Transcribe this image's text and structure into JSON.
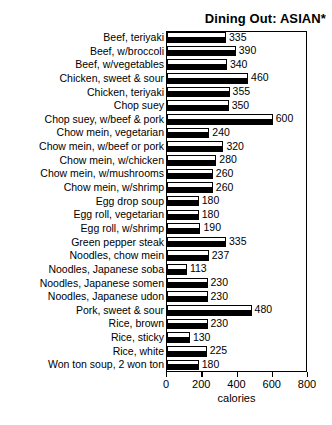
{
  "chart_data": {
    "type": "bar",
    "orientation": "horizontal",
    "title": "Dining Out: ASIAN*",
    "xlabel": "calories",
    "ylabel": "",
    "xlim": [
      0,
      800
    ],
    "xticks": [
      0,
      200,
      400,
      600,
      800
    ],
    "xtick_labels": [
      "0",
      "200",
      "400",
      "600",
      "800"
    ],
    "grid": false,
    "legend": false,
    "bar_style": {
      "face_color": "#ffffff",
      "edge_color": "#000000",
      "shadow_color": "#000000"
    },
    "categories": [
      "Beef, teriyaki",
      "Beef, w/broccoli",
      "Beef, w/vegetables",
      "Chicken, sweet & sour",
      "Chicken, teriyaki",
      "Chop suey",
      "Chop suey, w/beef & pork",
      "Chow mein, vegetarian",
      "Chow mein, w/beef or pork",
      "Chow mein, w/chicken",
      "Chow mein, w/mushrooms",
      "Chow mein, w/shrimp",
      "Egg drop soup",
      "Egg roll, vegetarian",
      "Egg roll, w/shrimp",
      "Green pepper steak",
      "Noodles, chow mein",
      "Noodles, Japanese soba",
      "Noodles, Japanese somen",
      "Noodles, Japanese udon",
      "Pork, sweet & sour",
      "Rice, brown",
      "Rice, sticky",
      "Rice, white",
      "Won ton soup, 2 won ton"
    ],
    "values": [
      335,
      390,
      340,
      460,
      355,
      350,
      600,
      240,
      320,
      280,
      260,
      260,
      180,
      180,
      190,
      335,
      237,
      113,
      230,
      230,
      480,
      230,
      130,
      225,
      180
    ],
    "value_labels": [
      "335",
      "390",
      "340",
      "460",
      "355",
      "350",
      "600",
      "240",
      "320",
      "280",
      "260",
      "260",
      "180",
      "180",
      "190",
      "335",
      "237",
      "113",
      "230",
      "230",
      "480",
      "230",
      "130",
      "225",
      "180"
    ]
  }
}
